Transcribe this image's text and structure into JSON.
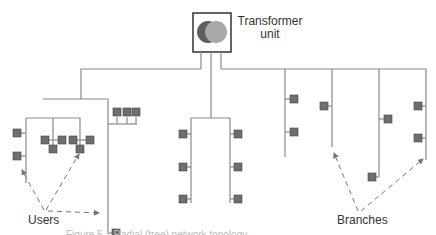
{
  "diagram": {
    "transformer": {
      "label_line1": "Transformer",
      "label_line2": "unit"
    },
    "labels": {
      "users": "Users",
      "branches": "Branches"
    },
    "caption": "Figure 5.1 Radial (tree) network topology",
    "colors": {
      "line": "#8a8a8a",
      "node_fill": "#6e6e6e",
      "node_stroke": "#444444",
      "circle_dark": "#5e5e5e",
      "circle_light": "#a8a8a8",
      "text": "#333333"
    }
  }
}
